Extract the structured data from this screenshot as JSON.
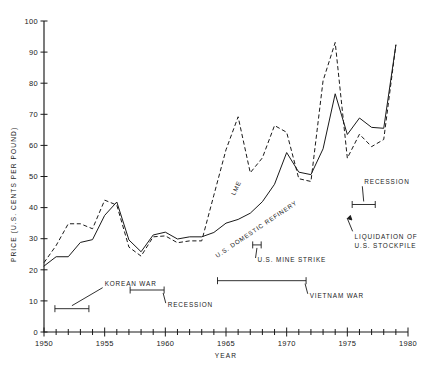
{
  "chart_data": {
    "type": "line",
    "title": "",
    "xlabel": "YEAR",
    "ylabel": "PRICE (U.S. CENTS PER POUND)",
    "xlim": [
      1950,
      1980
    ],
    "ylim": [
      0,
      100
    ],
    "xticks": [
      1950,
      1955,
      1960,
      1965,
      1970,
      1975,
      1980
    ],
    "xtick_labels": [
      "1950",
      "1955",
      "1960",
      "1965",
      "1970",
      "1975",
      "1980"
    ],
    "x_minor_tick_interval": 1,
    "yticks": [
      0,
      10,
      20,
      30,
      40,
      50,
      60,
      70,
      80,
      90,
      100
    ],
    "ytick_labels": [
      "0",
      "10",
      "20",
      "30",
      "40",
      "50",
      "60",
      "70",
      "80",
      "90",
      "100"
    ],
    "grid": false,
    "legend": "inline-curve-labels",
    "series": [
      {
        "name": "U.S. DOMESTIC REFINERY",
        "style": "solid",
        "x": [
          1950,
          1951,
          1952,
          1953,
          1954,
          1955,
          1956,
          1957,
          1958,
          1959,
          1960,
          1961,
          1962,
          1963,
          1964,
          1965,
          1966,
          1967,
          1968,
          1969,
          1970,
          1971,
          1972,
          1973,
          1974,
          1975,
          1976,
          1977,
          1978,
          1979
        ],
        "y": [
          21.2,
          24.2,
          24.2,
          28.8,
          29.7,
          37.5,
          41.8,
          29.6,
          25.8,
          31.2,
          32.1,
          29.9,
          30.6,
          30.6,
          32.0,
          35.0,
          36.2,
          38.2,
          41.9,
          47.5,
          57.7,
          51.4,
          50.6,
          58.9,
          76.6,
          63.5,
          68.8,
          65.8,
          65.5,
          92.3
        ]
      },
      {
        "name": "LME",
        "style": "dashed",
        "x": [
          1950,
          1951,
          1952,
          1953,
          1954,
          1955,
          1956,
          1957,
          1958,
          1959,
          1960,
          1961,
          1962,
          1963,
          1964,
          1965,
          1966,
          1967,
          1968,
          1969,
          1970,
          1971,
          1972,
          1973,
          1974,
          1975,
          1976,
          1977,
          1978,
          1979
        ],
        "y": [
          22.3,
          27.8,
          34.8,
          34.8,
          33.2,
          42.4,
          40.8,
          27.3,
          24.4,
          30.6,
          30.9,
          28.7,
          29.3,
          29.3,
          44.0,
          58.6,
          69.2,
          51.2,
          56.0,
          66.4,
          64.2,
          49.3,
          48.4,
          80.8,
          93.1,
          55.9,
          63.6,
          59.6,
          61.9,
          92.3
        ]
      }
    ],
    "annotations": [
      {
        "name": "korean-war",
        "label": "KOREAN WAR",
        "span_start": 1950.9,
        "span_end": 1953.7,
        "bracket_y": 7.5,
        "text_x": 1955.0,
        "text_y": 14.9
      },
      {
        "name": "recession-1958",
        "label": "RECESSION",
        "span_start": 1957.1,
        "span_end": 1959.9,
        "bracket_y": 13.5,
        "text_x": 1960.2,
        "text_y": 8.0
      },
      {
        "name": "us-mine-strike",
        "label": "U.S. MINE STRIKE",
        "span_start": 1967.2,
        "span_end": 1967.9,
        "bracket_y": 28.0,
        "text_x": 1967.6,
        "text_y": 22.5
      },
      {
        "name": "vietnam-war",
        "label": "VIETNAM WAR",
        "span_start": 1964.3,
        "span_end": 1971.6,
        "bracket_y": 16.5,
        "text_x": 1971.9,
        "text_y": 11.0
      },
      {
        "name": "recession-1975",
        "label": "RECESSION",
        "span_start": 1975.4,
        "span_end": 1977.3,
        "bracket_y": 41.0,
        "text_x": 1976.4,
        "text_y": 47.5
      },
      {
        "name": "liquidation-stockpile",
        "label_line1": "LIQUIDATION OF",
        "label_line2": "U.S. STOCKPILE",
        "arrow_x": 1975.0,
        "arrow_y": 36.5,
        "text_x": 1975.6,
        "text_y": 29.8
      }
    ],
    "curve_labels": [
      {
        "name": "lme-label",
        "text": "LME",
        "x": 1966.0,
        "y": 46.0,
        "rotation": -64
      },
      {
        "name": "us-domestic-refinery-label",
        "text": "U.S. DOMESTIC REFINERY",
        "x": 1967.6,
        "y": 32.5,
        "rotation": -34
      }
    ]
  }
}
